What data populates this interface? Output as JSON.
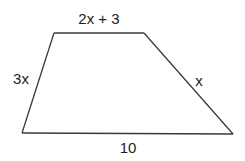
{
  "diagram": {
    "shape": "trapezoid",
    "labels": {
      "top": "2x + 3",
      "left": "3x",
      "right": "x",
      "bottom": "10"
    },
    "colors": {
      "stroke": "#3a3a3a",
      "text": "#222222",
      "background": "#ffffff"
    }
  }
}
